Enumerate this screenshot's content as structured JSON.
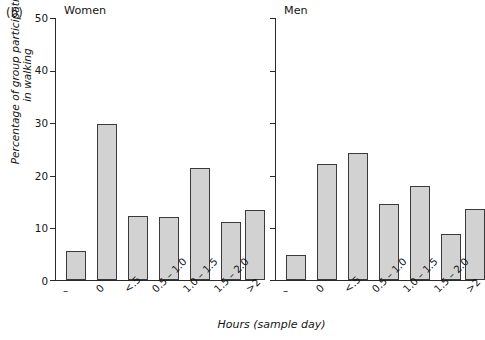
{
  "figure": {
    "panel_letter": "(b)",
    "y_axis_title_line1": "Percentage of group participating",
    "y_axis_title_line2": "in walking",
    "x_axis_title": "Hours (sample day)",
    "y_ticks": [
      "0",
      "10",
      "20",
      "30",
      "40",
      "50"
    ],
    "bar_fill": "#d2d2d2",
    "bar_stroke": "#3a3a3a",
    "axis_color": "#2a2a2a"
  },
  "chart_data": {
    "type": "bar",
    "title": "",
    "xlabel": "Hours (sample day)",
    "ylabel": "Percentage of group participating in walking",
    "ylim": [
      0,
      50
    ],
    "yticks": [
      0,
      10,
      20,
      30,
      40,
      50
    ],
    "grid": false,
    "legend": "none",
    "categories": [
      "–",
      "0",
      "<.5",
      "0.5 – 1.0",
      "1.0 – 1.5",
      "1.5 – 2.0",
      ">2"
    ],
    "panels": [
      {
        "name": "Women",
        "values": [
          5.5,
          29.7,
          12.2,
          12.1,
          21.4,
          11.0,
          13.3
        ]
      },
      {
        "name": "Men",
        "values": [
          4.7,
          22.2,
          24.2,
          14.5,
          18.0,
          8.7,
          13.5
        ]
      }
    ]
  }
}
